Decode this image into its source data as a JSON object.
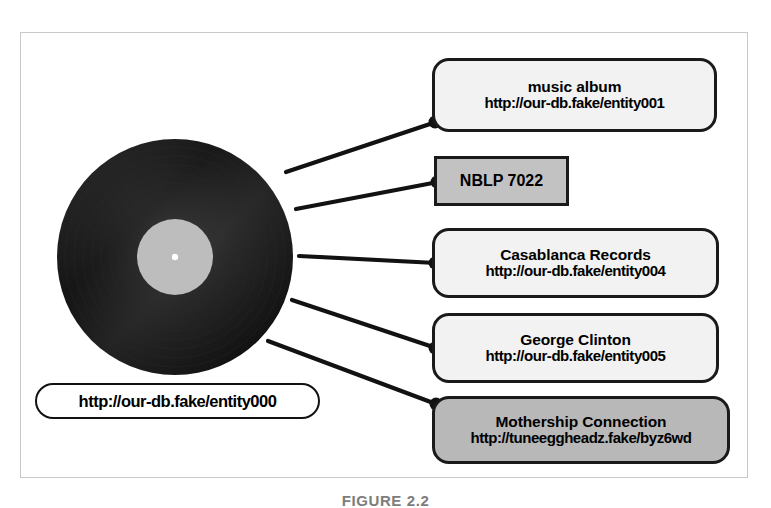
{
  "figure": {
    "caption": "FIGURE 2.2",
    "frame_color": "#c9c9c9",
    "background": "#ffffff"
  },
  "central_object": {
    "name": "vinyl-record",
    "disc_color": "#131313",
    "label_color": "#bdbdbd",
    "spindle_hole_color": "#ffffff",
    "identifier_node": {
      "line1": "http://our-db.fake/entity000",
      "shape": "pill",
      "fill": "#ffffff"
    }
  },
  "nodes": [
    {
      "id": "music-album",
      "line1": "music album",
      "line2": "http://our-db.fake/entity001",
      "shape": "rounded-rect",
      "fill": "#f2f2f2",
      "border": "#1a1a1a"
    },
    {
      "id": "nblp",
      "line1": "NBLP 7022",
      "line2": "",
      "shape": "rect",
      "fill": "#c2c2c2",
      "border": "#1a1a1a"
    },
    {
      "id": "casablanca",
      "line1": "Casablanca Records",
      "line2": "http://our-db.fake/entity004",
      "shape": "rounded-rect",
      "fill": "#f2f2f2",
      "border": "#1a1a1a"
    },
    {
      "id": "george-clinton",
      "line1": "George Clinton",
      "line2": "http://our-db.fake/entity005",
      "shape": "rounded-rect",
      "fill": "#f2f2f2",
      "border": "#1a1a1a"
    },
    {
      "id": "mothership",
      "line1": "Mothership Connection",
      "line2": "http://tuneeggheadz.fake/byz6wd",
      "shape": "rounded-rect",
      "fill": "#b8b8b8",
      "border": "#1a1a1a"
    }
  ],
  "connectors": {
    "count": 5,
    "line_color": "#121212",
    "endpoint_dot_color": "#121212"
  }
}
